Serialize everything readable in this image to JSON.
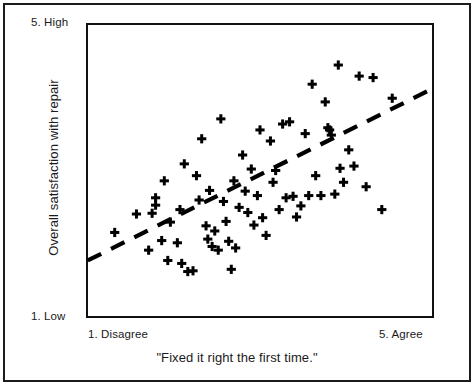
{
  "figure": {
    "frame": {
      "x": 86,
      "y": 23,
      "width": 348,
      "height": 295
    }
  },
  "axes": {
    "y_top_label": "5. High",
    "y_bottom_label": "1. Low",
    "y_title": "Overall satisfaction with repair",
    "x_left_label": "1. Disagree",
    "x_right_label": "5. Agree",
    "x_title": "\"Fixed it right the first time.\""
  },
  "chart_data": {
    "type": "scatter",
    "title": "",
    "xlabel": "\"Fixed it right the first time.\"",
    "ylabel": "Overall satisfaction with repair",
    "xlim": [
      1,
      5
    ],
    "ylim": [
      1,
      5
    ],
    "xtick_labels": [
      "1. Disagree",
      "5. Agree"
    ],
    "ytick_labels": [
      "1. Low",
      "5. High"
    ],
    "grid": false,
    "legend": false,
    "marker": "plus",
    "marker_color": "#000000",
    "point_count": 72,
    "points": [
      [
        1.33,
        2.16
      ],
      [
        1.58,
        2.41
      ],
      [
        1.72,
        1.92
      ],
      [
        1.76,
        2.42
      ],
      [
        1.8,
        2.63
      ],
      [
        1.8,
        2.53
      ],
      [
        1.87,
        2.05
      ],
      [
        1.9,
        2.86
      ],
      [
        1.94,
        1.78
      ],
      [
        1.97,
        2.3
      ],
      [
        2.05,
        2.02
      ],
      [
        2.08,
        2.47
      ],
      [
        2.1,
        1.74
      ],
      [
        2.13,
        3.09
      ],
      [
        2.17,
        1.63
      ],
      [
        2.23,
        1.64
      ],
      [
        2.27,
        2.93
      ],
      [
        2.3,
        2.6
      ],
      [
        2.33,
        3.43
      ],
      [
        2.38,
        2.25
      ],
      [
        2.4,
        2.07
      ],
      [
        2.42,
        2.73
      ],
      [
        2.45,
        1.97
      ],
      [
        2.48,
        2.18
      ],
      [
        2.52,
        1.92
      ],
      [
        2.55,
        3.7
      ],
      [
        2.58,
        2.58
      ],
      [
        2.61,
        2.31
      ],
      [
        2.64,
        2.04
      ],
      [
        2.67,
        1.66
      ],
      [
        2.7,
        2.86
      ],
      [
        2.72,
        1.95
      ],
      [
        2.76,
        2.5
      ],
      [
        2.8,
        3.21
      ],
      [
        2.83,
        2.72
      ],
      [
        2.86,
        2.43
      ],
      [
        2.9,
        3.02
      ],
      [
        2.93,
        2.26
      ],
      [
        2.97,
        2.66
      ],
      [
        3.0,
        3.55
      ],
      [
        3.03,
        2.36
      ],
      [
        3.07,
        2.12
      ],
      [
        3.12,
        3.4
      ],
      [
        3.15,
        2.84
      ],
      [
        3.18,
        3.0
      ],
      [
        3.22,
        2.47
      ],
      [
        3.26,
        3.63
      ],
      [
        3.3,
        2.63
      ],
      [
        3.34,
        3.66
      ],
      [
        3.38,
        2.65
      ],
      [
        3.42,
        2.37
      ],
      [
        3.47,
        2.52
      ],
      [
        3.52,
        3.5
      ],
      [
        3.56,
        2.66
      ],
      [
        3.6,
        4.17
      ],
      [
        3.64,
        2.93
      ],
      [
        3.7,
        2.66
      ],
      [
        3.75,
        3.93
      ],
      [
        3.78,
        3.58
      ],
      [
        3.8,
        3.55
      ],
      [
        3.82,
        3.48
      ],
      [
        3.86,
        2.68
      ],
      [
        3.9,
        4.43
      ],
      [
        3.92,
        3.03
      ],
      [
        3.96,
        2.84
      ],
      [
        4.02,
        3.28
      ],
      [
        4.08,
        3.06
      ],
      [
        4.14,
        4.28
      ],
      [
        4.22,
        2.78
      ],
      [
        4.3,
        4.26
      ],
      [
        4.4,
        2.47
      ],
      [
        4.52,
        3.98
      ]
    ],
    "trendline": {
      "style": "dashed",
      "color": "#000000",
      "x_start": 1.02,
      "y_start": 1.78,
      "x_end": 5.0,
      "y_end": 4.12,
      "description": "positive linear trend"
    }
  }
}
